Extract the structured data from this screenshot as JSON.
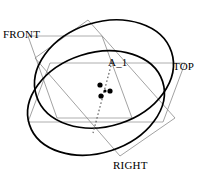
{
  "figure": {
    "type": "technical-line-diagram",
    "width": 202,
    "height": 179,
    "background_color": "#ffffff",
    "stroke_colors": {
      "cylinder_outline": "#000000",
      "plane_edges": "#808080",
      "plane_horizontal_edges": "#9a9a9a",
      "axis_dotted": "#555555",
      "points": "#000000"
    },
    "labels": {
      "front": "FRONT",
      "top": "TOP",
      "right": "RIGHT",
      "axis": "A_1"
    },
    "cylinder": {
      "far_ellipse": {
        "cx": 104,
        "cy": 74,
        "rx": 71,
        "ry": 52,
        "rotation_deg": -18
      },
      "near_ellipse": {
        "cx": 96,
        "cy": 103,
        "rx": 70,
        "ry": 50,
        "rotation_deg": -18
      }
    },
    "planes": [
      {
        "name": "front",
        "label": "FRONT",
        "points": "28,36 102,36 132,118 57,118"
      },
      {
        "name": "top",
        "label": "TOP",
        "points": "50,63 185,63 163,122 28,122"
      },
      {
        "name": "right",
        "label": "RIGHT",
        "points": "88,20 175,118 120,156 35,58"
      }
    ],
    "points_cluster": [
      {
        "id": "p1",
        "x": 100,
        "y": 85,
        "r": 2.6
      },
      {
        "id": "p2",
        "x": 110,
        "y": 91,
        "r": 2.6
      },
      {
        "id": "p3",
        "x": 101,
        "y": 96,
        "r": 2.6
      },
      {
        "id": "p4",
        "x": 105,
        "y": 91,
        "r": 1.6
      }
    ],
    "axis_line": {
      "name": "A_1",
      "style": "dotted",
      "x1": 112,
      "y1": 62,
      "x2": 93,
      "y2": 133
    }
  }
}
